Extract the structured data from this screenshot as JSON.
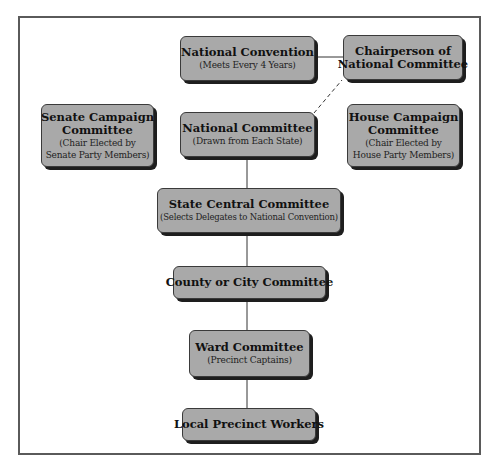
{
  "diagram": {
    "type": "org-chart",
    "nodes": {
      "national_convention": {
        "title": "National Convention",
        "subtitle": "(Meets Every 4 Years)"
      },
      "chairperson": {
        "title_line1": "Chairperson of",
        "title_line2": "National Committee"
      },
      "senate_campaign": {
        "title_line1": "Senate Campaign",
        "title_line2": "Committee",
        "sub_line1": "(Chair Elected by",
        "sub_line2": "Senate Party Members)"
      },
      "national_committee": {
        "title": "National Committee",
        "subtitle": "(Drawn from Each State)"
      },
      "house_campaign": {
        "title_line1": "House Campaign",
        "title_line2": "Committee",
        "sub_line1": "(Chair Elected by",
        "sub_line2": "House Party Members)"
      },
      "state_central": {
        "title": "State Central Committee",
        "subtitle": "(Selects Delegates to National Convention)"
      },
      "county_city": {
        "title": "County or City Committee"
      },
      "ward": {
        "title": "Ward Committee",
        "subtitle": "(Precinct Captains)"
      },
      "local_precinct": {
        "title": "Local Precinct Workers"
      }
    },
    "edges": [
      {
        "from": "national_convention",
        "to": "chairperson",
        "style": "solid"
      },
      {
        "from": "national_committee",
        "to": "chairperson",
        "style": "dashed"
      },
      {
        "from": "national_committee",
        "to": "state_central",
        "style": "solid"
      },
      {
        "from": "state_central",
        "to": "county_city",
        "style": "solid"
      },
      {
        "from": "county_city",
        "to": "ward",
        "style": "solid"
      },
      {
        "from": "ward",
        "to": "local_precinct",
        "style": "solid"
      }
    ],
    "colors": {
      "box_fill": "#a9a9a9",
      "box_shadow": "#1e1e1e",
      "line": "#333333",
      "frame": "#5a5a5a"
    }
  }
}
